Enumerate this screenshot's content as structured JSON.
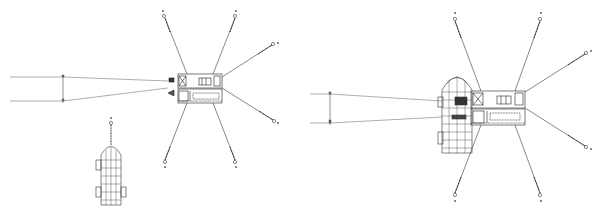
{
  "diagram": {
    "type": "mooring-arrangement-plan",
    "colors": {
      "line": "#555555",
      "dark": "#222222",
      "background": "#ffffff"
    },
    "panels": [
      {
        "name": "left-panel",
        "description": "Barge moored with 6 spread anchors; vessel separate below",
        "barge": {
          "x": 178,
          "y": 74,
          "w": 45,
          "h": 29
        },
        "anchors": [
          {
            "id": "a1",
            "x": 164,
            "y": 16,
            "label": ""
          },
          {
            "id": "a2",
            "x": 235,
            "y": 16,
            "label": ""
          },
          {
            "id": "a3",
            "x": 273,
            "y": 44,
            "label": ""
          },
          {
            "id": "a4",
            "x": 274,
            "y": 121,
            "label": ""
          },
          {
            "id": "a5",
            "x": 165,
            "y": 162,
            "label": ""
          },
          {
            "id": "a6",
            "x": 235,
            "y": 162,
            "label": ""
          }
        ],
        "stern_lines": {
          "x_start": 10,
          "y_top": 77,
          "y_bottom": 101,
          "dim_x": 63
        },
        "vessel": {
          "x": 96,
          "y": 145,
          "w": 27,
          "h": 60,
          "anchor_x": 111,
          "anchor_y": 123
        }
      },
      {
        "name": "right-panel",
        "description": "Vessel berthed alongside moored barge",
        "barge": {
          "x": 471,
          "y": 91,
          "w": 54,
          "h": 34
        },
        "vessel": {
          "x": 442,
          "y": 75,
          "w": 30,
          "h": 78
        },
        "anchors": [
          {
            "id": "b1",
            "x": 455,
            "y": 19,
            "label": ""
          },
          {
            "id": "b2",
            "x": 540,
            "y": 19,
            "label": ""
          },
          {
            "id": "b3",
            "x": 586,
            "y": 53,
            "label": ""
          },
          {
            "id": "b4",
            "x": 586,
            "y": 147,
            "label": ""
          },
          {
            "id": "b5",
            "x": 455,
            "y": 195,
            "label": ""
          },
          {
            "id": "b6",
            "x": 540,
            "y": 195,
            "label": ""
          }
        ],
        "stern_lines": {
          "x_start": 310,
          "y_top": 94,
          "y_bottom": 123,
          "dim_x": 330
        }
      }
    ]
  }
}
